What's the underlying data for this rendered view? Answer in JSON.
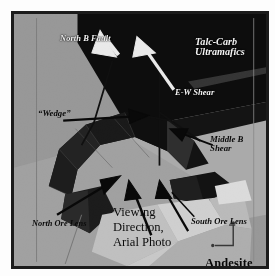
{
  "figure": {
    "kind": "geological-block-diagram",
    "frame_color": "#1b1b1b",
    "background_color": "#9a9a9a"
  },
  "palette": {
    "ultramafics_dark": "#0d0d0d",
    "host_rock_mid_gray": "#9b9b9b",
    "host_rock_light_gray": "#b3b3b3",
    "ore_body_black": "#121212",
    "ore_body_dark_gray": "#3a3a3a",
    "andesite_light": "#c9c9c9",
    "andesite_pale": "#dcdcdc",
    "white_label": "#f4f4f4",
    "black_label": "#0b0b0b"
  },
  "labels": {
    "north_b_fault": "North B Fault",
    "talc_carb_ultramafics": "Talc-Carb\nUltramafics",
    "ew_shear": "E-W Shear",
    "wedge": "“Wedge”",
    "middle_b_shear": "Middle B\nShear",
    "viewing_direction": "Viewing\nDirection,\nArial Photo",
    "south_ore_lens": "South Ore Lens",
    "north_ore_lens": "North Ore Lens",
    "andesite": "Andesite"
  },
  "annotations": {
    "white_arrows": [
      {
        "name": "north-b-fault-arrow",
        "points_to": "fault trace at unit contact"
      },
      {
        "name": "ew-shear-arrow",
        "points_to": "east-west shear zone"
      }
    ],
    "black_arrows": [
      {
        "name": "wedge-arrow",
        "points_to": "wedge block"
      },
      {
        "name": "middle-b-shear-arrow",
        "points_to": "middle B shear surface"
      },
      {
        "name": "north-ore-lens-arrow",
        "points_to": "north ore lens"
      },
      {
        "name": "viewing-direction-arrow",
        "points_to": "aerial photo viewing direction"
      },
      {
        "name": "south-ore-lens-arrow",
        "points_to": "south ore lens"
      }
    ],
    "corner_marker": {
      "name": "axis-corner-bracket",
      "color": "#3c3c3c"
    }
  }
}
